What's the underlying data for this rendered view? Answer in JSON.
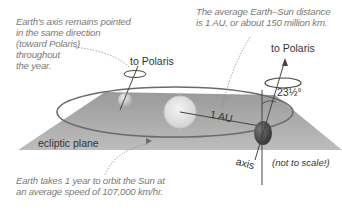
{
  "diagram": {
    "annotations": {
      "axis_note": [
        "Earth's axis remains pointed",
        "in the same direction",
        "(toward Polaris)",
        "throughout",
        "the year."
      ],
      "distance_note": [
        "The average Earth–Sun distance",
        "is 1 AU, or about 150 million km."
      ],
      "orbit_note": [
        "Earth takes 1 year to orbit the Sun at",
        "an average speed of 107,000 km/hr."
      ]
    },
    "labels": {
      "to_polaris_left": "to Polaris",
      "to_polaris_right": "to Polaris",
      "tilt_angle": "23½°",
      "au": "1 AU",
      "ecliptic_plane": "ecliptic plane",
      "axis": "axis",
      "not_to_scale": "(not to scale!)"
    },
    "colors": {
      "plane": "#a8a8a8",
      "orbit": "#6a6a6a",
      "sun": "#e6e6e6",
      "earth_left": "#cfcfcf",
      "earth_right": "#555555",
      "note_text": "#7a7a7a"
    }
  }
}
